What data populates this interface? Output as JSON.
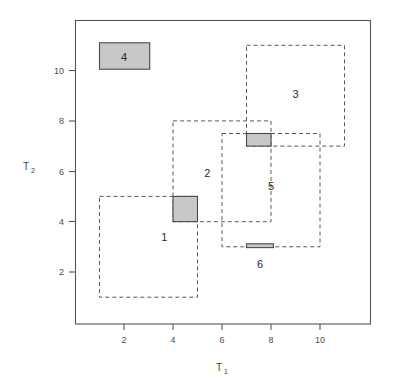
{
  "chart_data": {
    "type": "scatter",
    "title": "",
    "xlabel": "T_1",
    "ylabel": "T_2",
    "xlabel_base": "T",
    "xlabel_sub": "1",
    "ylabel_base": "T",
    "ylabel_sub": "2",
    "xlim": [
      0.0,
      12.1
    ],
    "ylim": [
      0.3,
      11.8
    ],
    "xticks": [
      2,
      4,
      6,
      8,
      10
    ],
    "yticks": [
      2,
      4,
      6,
      8,
      10
    ],
    "xtick_labels": [
      "2",
      "4",
      "6",
      "8",
      "10"
    ],
    "ytick_labels": [
      "2",
      "4",
      "6",
      "8",
      "10"
    ],
    "grid": false,
    "legend": "none",
    "fill_color": "#c8c8c8",
    "outline_color": "#5a5a5a",
    "frame_color": "#555555",
    "rectangles": [
      {
        "label": "1",
        "x0": 1.0,
        "x1": 5.0,
        "y0": 1.0,
        "y1": 5.0,
        "style": "dashed",
        "label_x": 3.65,
        "label_y": 3.4
      },
      {
        "label": "2",
        "x0": 4.0,
        "x1": 8.0,
        "y0": 4.0,
        "y1": 8.0,
        "style": "dashed",
        "label_x": 5.4,
        "label_y": 5.95
      },
      {
        "label": "3",
        "x0": 7.0,
        "x1": 11.0,
        "y0": 7.0,
        "y1": 11.0,
        "style": "dashed",
        "label_x": 9.0,
        "label_y": 9.05
      },
      {
        "label": "5",
        "x0": 6.0,
        "x1": 10.0,
        "y0": 3.0,
        "y1": 7.5,
        "style": "dashed",
        "label_x": 8.0,
        "label_y": 5.4
      },
      {
        "label": "4",
        "x0": 1.0,
        "x1": 3.05,
        "y0": 10.05,
        "y1": 11.1,
        "style": "filled",
        "label_x": 2.0,
        "label_y": 10.55
      },
      {
        "label": "6",
        "x0": 7.0,
        "x1": 8.1,
        "y0": 2.97,
        "y1": 3.12,
        "style": "filled",
        "label_x": 7.55,
        "label_y": 2.3
      }
    ],
    "overlaps": [
      {
        "x0": 4.0,
        "x1": 5.0,
        "y0": 4.0,
        "y1": 5.0
      },
      {
        "x0": 7.0,
        "x1": 8.0,
        "y0": 7.0,
        "y1": 7.5
      }
    ]
  },
  "figure": {
    "background": "#ffffff",
    "name": "rectangle-overlap-plot"
  }
}
